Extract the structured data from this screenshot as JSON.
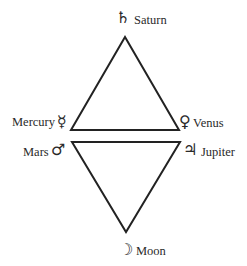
{
  "diagram": {
    "upper_triangle": {
      "points": [
        [
          125,
          37
        ],
        [
          71,
          130
        ],
        [
          179,
          130
        ]
      ],
      "vertices": [
        {
          "planet": "Saturn",
          "symbol": "♄"
        },
        {
          "planet": "Mercury",
          "symbol": "☿"
        },
        {
          "planet": "Venus",
          "symbol": "♀"
        }
      ]
    },
    "lower_triangle": {
      "points": [
        [
          72,
          142
        ],
        [
          180,
          142
        ],
        [
          126,
          232
        ]
      ],
      "vertices": [
        {
          "planet": "Mars",
          "symbol": "♂"
        },
        {
          "planet": "Jupiter",
          "symbol": "♃"
        },
        {
          "planet": "Moon",
          "symbol": "☽"
        }
      ]
    },
    "labels": {
      "saturn": {
        "name": "Saturn",
        "symbol": "♄"
      },
      "mercury": {
        "name": "Mercury",
        "symbol": "☿"
      },
      "venus": {
        "name": "Venus",
        "symbol": "♀"
      },
      "mars": {
        "name": "Mars",
        "symbol": "♂"
      },
      "jupiter": {
        "name": "Jupiter",
        "symbol": "♃"
      },
      "moon": {
        "name": "Moon",
        "symbol": "☽"
      }
    },
    "line_color": "#222222"
  }
}
